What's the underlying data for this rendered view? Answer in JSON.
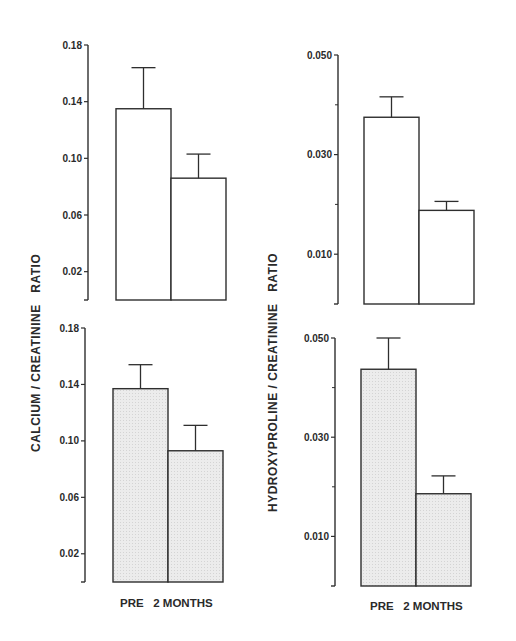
{
  "figure": {
    "left_ylabel": "CALCIUM / CREATININE   RATIO",
    "right_ylabel": "HYDROXYPROLINE / CREATININE   RATIO",
    "xlabel_left": "PRE   2 MONTHS",
    "xlabel_right": "PRE   2 MONTHS"
  },
  "colors": {
    "line": "#2e2e2e",
    "bar_open": "#ffffff",
    "bar_stippled": "#ececec"
  },
  "chart_data": [
    {
      "type": "bar",
      "panel": "top-left",
      "title": "",
      "ylabel": "Calcium / Creatinine Ratio",
      "xlabel": "",
      "categories": [
        "PRE",
        "2 MONTHS"
      ],
      "values": [
        0.135,
        0.086
      ],
      "error_upper": [
        0.164,
        0.103
      ],
      "yticks": [
        "0.02",
        "0.06",
        "0.10",
        "0.14",
        "0.18"
      ],
      "ylim": [
        0,
        0.18
      ],
      "fill": "open",
      "grid": false
    },
    {
      "type": "bar",
      "panel": "top-right",
      "title": "",
      "ylabel": "Hydroxyproline / Creatinine Ratio",
      "xlabel": "",
      "categories": [
        "PRE",
        "2 MONTHS"
      ],
      "values": [
        0.0375,
        0.0188
      ],
      "error_upper": [
        0.0416,
        0.0206
      ],
      "yticks": [
        "0.010",
        "0.030",
        "0.050"
      ],
      "minor_yticks": [
        0.02,
        0.04
      ],
      "ylim": [
        0,
        0.05
      ],
      "fill": "open",
      "grid": false
    },
    {
      "type": "bar",
      "panel": "bottom-left",
      "title": "",
      "ylabel": "Calcium / Creatinine Ratio",
      "xlabel": "PRE   2 MONTHS",
      "categories": [
        "PRE",
        "2 MONTHS"
      ],
      "values": [
        0.137,
        0.093
      ],
      "error_upper": [
        0.154,
        0.111
      ],
      "yticks": [
        "0.02",
        "0.06",
        "0.10",
        "0.14",
        "0.18"
      ],
      "ylim": [
        0,
        0.18
      ],
      "fill": "stippled",
      "grid": false
    },
    {
      "type": "bar",
      "panel": "bottom-right",
      "title": "",
      "ylabel": "Hydroxyproline / Creatinine Ratio",
      "xlabel": "PRE   2 MONTHS",
      "categories": [
        "PRE",
        "2 MONTHS"
      ],
      "values": [
        0.0437,
        0.0186
      ],
      "error_upper": [
        0.05,
        0.0222
      ],
      "yticks": [
        "0.010",
        "0.030",
        "0.050"
      ],
      "minor_yticks": [
        0.02,
        0.04
      ],
      "ylim": [
        0,
        0.05
      ],
      "fill": "stippled",
      "grid": false
    }
  ]
}
